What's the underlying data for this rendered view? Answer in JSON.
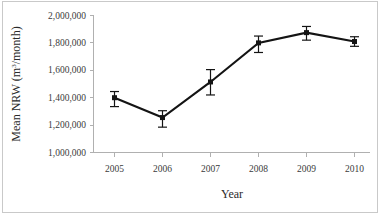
{
  "chart_data": {
    "type": "line",
    "title": "",
    "subtitle": "",
    "xlabel": "Year",
    "ylabel": "Mean NRW (m³/month)",
    "ylabel_base": "Mean NRW (m",
    "ylabel_sup": "3",
    "ylabel_tail": "/month)",
    "categories": [
      2005,
      2006,
      2007,
      2008,
      2009,
      2010
    ],
    "x_tick_labels": [
      "2005",
      "2006",
      "2007",
      "2008",
      "2009",
      "2010"
    ],
    "y_tick_labels": [
      "2,000,000",
      "1,800,000",
      "1,600,000",
      "1,400,000",
      "1,200,000",
      "1,000,000"
    ],
    "y_tick_values": [
      2000000,
      1800000,
      1600000,
      1400000,
      1200000,
      1000000
    ],
    "ylim": [
      1000000,
      2000000
    ],
    "xlim": [
      2004.5,
      2010.5
    ],
    "grid": false,
    "legend": "none",
    "series": [
      {
        "name": "Mean NRW",
        "marker": "square",
        "color": "#141414",
        "values": [
          1400000,
          1255000,
          1515000,
          1800000,
          1875000,
          1810000
        ],
        "error_low": [
          1335000,
          1185000,
          1420000,
          1730000,
          1820000,
          1775000
        ],
        "error_high": [
          1445000,
          1305000,
          1605000,
          1850000,
          1920000,
          1845000
        ]
      }
    ]
  },
  "figure": {
    "caption": "",
    "border_color": "#c9c9c9",
    "axis_color": "#b0b0b0",
    "series_color": "#141414",
    "background": "#ffffff"
  }
}
